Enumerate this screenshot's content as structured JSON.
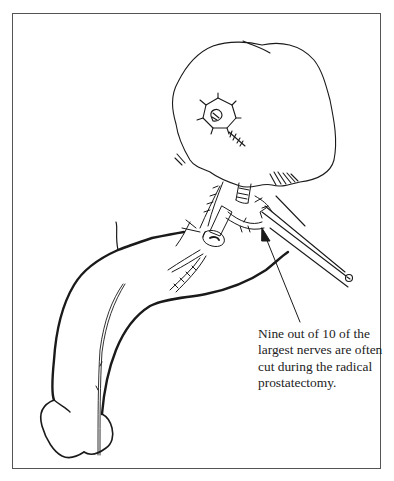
{
  "figure": {
    "parts": {
      "bladder": "bladder",
      "nerves": "neurovascular-bundle",
      "penis": "penis",
      "scissors": "surgical-scissors",
      "pointer": "pointer-arrow"
    },
    "colors": {
      "line": "#1a1a1a",
      "frame": "#555555",
      "background": "#ffffff"
    }
  },
  "caption": {
    "lines": [
      "Nine out of 10 of the",
      "largest nerves are often",
      "cut during the radical",
      "prostatectomy."
    ]
  }
}
